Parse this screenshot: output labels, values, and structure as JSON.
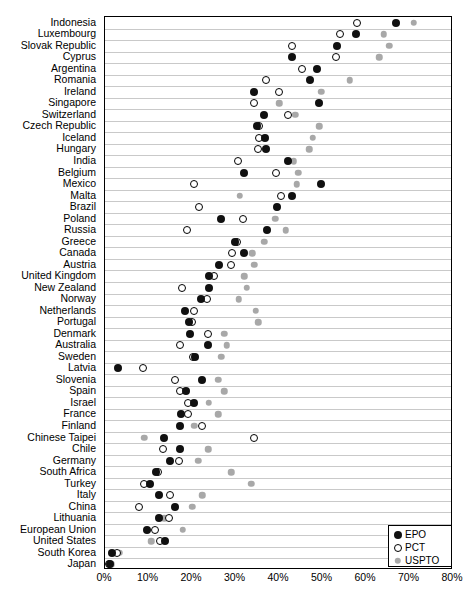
{
  "chart_data": {
    "type": "scatter",
    "title": "",
    "subtitle": "",
    "xlabel": "",
    "ylabel": "",
    "xlim": [
      0,
      80
    ],
    "xunit": "%",
    "grid": true,
    "legend_position": "bottom-right",
    "xticks": [
      "0%",
      "10%",
      "20%",
      "30%",
      "40%",
      "50%",
      "60%",
      "70%",
      "80%"
    ],
    "xtick_values": [
      0,
      10,
      20,
      30,
      40,
      50,
      60,
      70,
      80
    ],
    "legend": [
      {
        "name": "EPO",
        "style": "filled-black",
        "color": "#101010"
      },
      {
        "name": "PCT",
        "style": "open-circle",
        "color": "#ffffff"
      },
      {
        "name": "USPTO",
        "style": "filled-gray",
        "color": "#a8a8a8"
      }
    ],
    "categories": [
      "Indonesia",
      "Luxembourg",
      "Slovak Republic",
      "Cyprus",
      "Argentina",
      "Romania",
      "Ireland",
      "Singapore",
      "Switzerland",
      "Czech Republic",
      "Iceland",
      "Hungary",
      "India",
      "Belgium",
      "Mexico",
      "Malta",
      "Brazil",
      "Poland",
      "Russia",
      "Greece",
      "Canada",
      "Austria",
      "United Kingdom",
      "New Zealand",
      "Norway",
      "Netherlands",
      "Portugal",
      "Denmark",
      "Australia",
      "Sweden",
      "Latvia",
      "Slovenia",
      "Spain",
      "Israel",
      "France",
      "Finland",
      "Chinese Taipei",
      "Chile",
      "Germany",
      "South Africa",
      "Turkey",
      "Italy",
      "China",
      "Lithuania",
      "European Union",
      "United States",
      "South Korea",
      "Japan"
    ],
    "series": [
      {
        "name": "EPO",
        "values": [
          66.9,
          57.7,
          53.3,
          43.0,
          48.7,
          47.1,
          34.3,
          49.2,
          36.6,
          35.0,
          36.8,
          37.0,
          42.1,
          32.0,
          49.7,
          43.0,
          39.5,
          26.7,
          37.2,
          29.9,
          31.9,
          26.2,
          23.9,
          23.9,
          22.1,
          18.4,
          19.3,
          19.5,
          23.7,
          20.6,
          3.0,
          22.3,
          18.6,
          20.5,
          17.5,
          17.2,
          13.6,
          17.2,
          14.9,
          11.7,
          10.3,
          12.4,
          16.1,
          12.4,
          9.7,
          13.8,
          1.6,
          1.2
        ]
      },
      {
        "name": "PCT",
        "values": [
          57.9,
          54.0,
          43.0,
          53.1,
          45.3,
          37.0,
          40.0,
          34.3,
          42.1,
          35.4,
          35.4,
          35.2,
          30.6,
          39.3,
          20.5,
          40.5,
          21.6,
          31.7,
          18.9,
          30.4,
          29.2,
          29.0,
          25.1,
          17.7,
          23.4,
          20.5,
          20.1,
          23.7,
          17.2,
          20.2,
          8.7,
          16.1,
          17.2,
          19.1,
          19.1,
          22.3,
          34.3,
          13.3,
          17.0,
          12.2,
          9.0,
          14.9,
          7.8,
          14.7,
          11.5,
          12.6,
          2.8,
          1.0
        ]
      },
      {
        "name": "USPTO",
        "values": [
          71.0,
          64.1,
          65.3,
          63.0,
          48.7,
          56.3,
          49.7,
          40.0,
          43.7,
          49.2,
          47.8,
          46.9,
          43.4,
          44.4,
          44.1,
          31.0,
          39.5,
          39.1,
          41.6,
          36.6,
          33.8,
          34.3,
          32.0,
          32.6,
          30.8,
          34.7,
          35.2,
          27.4,
          28.0,
          26.7,
          null,
          26.0,
          27.4,
          23.9,
          26.0,
          20.5,
          9.0,
          23.7,
          21.4,
          29.0,
          33.6,
          22.3,
          20.0,
          13.6,
          17.9,
          10.6,
          3.4,
          1.4
        ]
      }
    ]
  }
}
